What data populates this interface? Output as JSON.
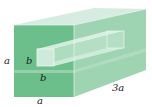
{
  "figure": {
    "labels": {
      "height": "a",
      "width": "a",
      "length": "3a",
      "hole_height": "b",
      "hole_width": "b"
    },
    "colors": {
      "front_face": "#6cbf8a",
      "top_face": "#d6ece0",
      "side_face": "#9fd4b3",
      "hole_inner": "#cfe9da",
      "edge": "#e9f5ee"
    }
  }
}
